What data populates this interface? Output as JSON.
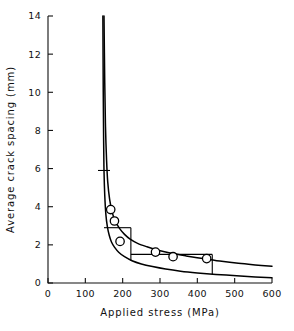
{
  "chart_data": {
    "type": "line",
    "title": "",
    "xlabel": "Applied stress (MPa)",
    "ylabel": "Average crack spacing (mm)",
    "xlim": [
      0,
      600
    ],
    "ylim": [
      0,
      14
    ],
    "xticks": [
      0,
      100,
      200,
      300,
      400,
      500,
      600
    ],
    "yticks": [
      0,
      2,
      4,
      6,
      8,
      10,
      12,
      14
    ],
    "xtick_labels": [
      "0",
      "100",
      "200",
      "300",
      "400",
      "500",
      "600"
    ],
    "ytick_labels": [
      "0",
      "2",
      "4",
      "6",
      "8",
      "10",
      "12",
      "14"
    ],
    "grid": false,
    "legend": null,
    "series": [
      {
        "name": "upper-bound-curve",
        "style": "solid",
        "points": [
          [
            150,
            14.0
          ],
          [
            152,
            10.5
          ],
          [
            154,
            8.2
          ],
          [
            157,
            6.4
          ],
          [
            160,
            5.3
          ],
          [
            165,
            4.4
          ],
          [
            172,
            3.7
          ],
          [
            180,
            3.25
          ],
          [
            192,
            2.85
          ],
          [
            205,
            2.55
          ],
          [
            220,
            2.3
          ],
          [
            240,
            2.08
          ],
          [
            265,
            1.9
          ],
          [
            295,
            1.72
          ],
          [
            330,
            1.56
          ],
          [
            370,
            1.42
          ],
          [
            415,
            1.28
          ],
          [
            460,
            1.15
          ],
          [
            510,
            1.03
          ],
          [
            555,
            0.95
          ],
          [
            600,
            0.88
          ]
        ]
      },
      {
        "name": "lower-bound-curve",
        "style": "solid",
        "points": [
          [
            147,
            14.0
          ],
          [
            148,
            10.0
          ],
          [
            149,
            7.5
          ],
          [
            150,
            5.9
          ],
          [
            152,
            4.6
          ],
          [
            155,
            3.6
          ],
          [
            159,
            2.95
          ],
          [
            164,
            2.5
          ],
          [
            170,
            2.15
          ],
          [
            178,
            1.88
          ],
          [
            190,
            1.6
          ],
          [
            205,
            1.38
          ],
          [
            225,
            1.17
          ],
          [
            250,
            1.0
          ],
          [
            280,
            0.86
          ],
          [
            315,
            0.73
          ],
          [
            355,
            0.62
          ],
          [
            400,
            0.53
          ],
          [
            450,
            0.45
          ],
          [
            505,
            0.38
          ],
          [
            555,
            0.32
          ],
          [
            600,
            0.28
          ]
        ]
      }
    ],
    "scatter_points": [
      {
        "x": 168,
        "y": 3.85
      },
      {
        "x": 178,
        "y": 3.25
      },
      {
        "x": 193,
        "y": 2.18
      },
      {
        "x": 288,
        "y": 1.62
      },
      {
        "x": 335,
        "y": 1.38
      },
      {
        "x": 425,
        "y": 1.28
      }
    ],
    "tie_lines": [
      {
        "orientation": "horizontal",
        "y": 5.9,
        "x_start": 134,
        "x_end": 166
      },
      {
        "orientation": "horizontal",
        "y": 2.9,
        "x_start": 150,
        "x_end": 222
      },
      {
        "orientation": "vertical",
        "x": 222,
        "y_start": 1.17,
        "y_end": 2.9
      },
      {
        "orientation": "horizontal",
        "y": 1.5,
        "x_start": 222,
        "x_end": 440
      },
      {
        "orientation": "vertical",
        "x": 440,
        "y_start": 0.46,
        "y_end": 1.5
      }
    ]
  }
}
